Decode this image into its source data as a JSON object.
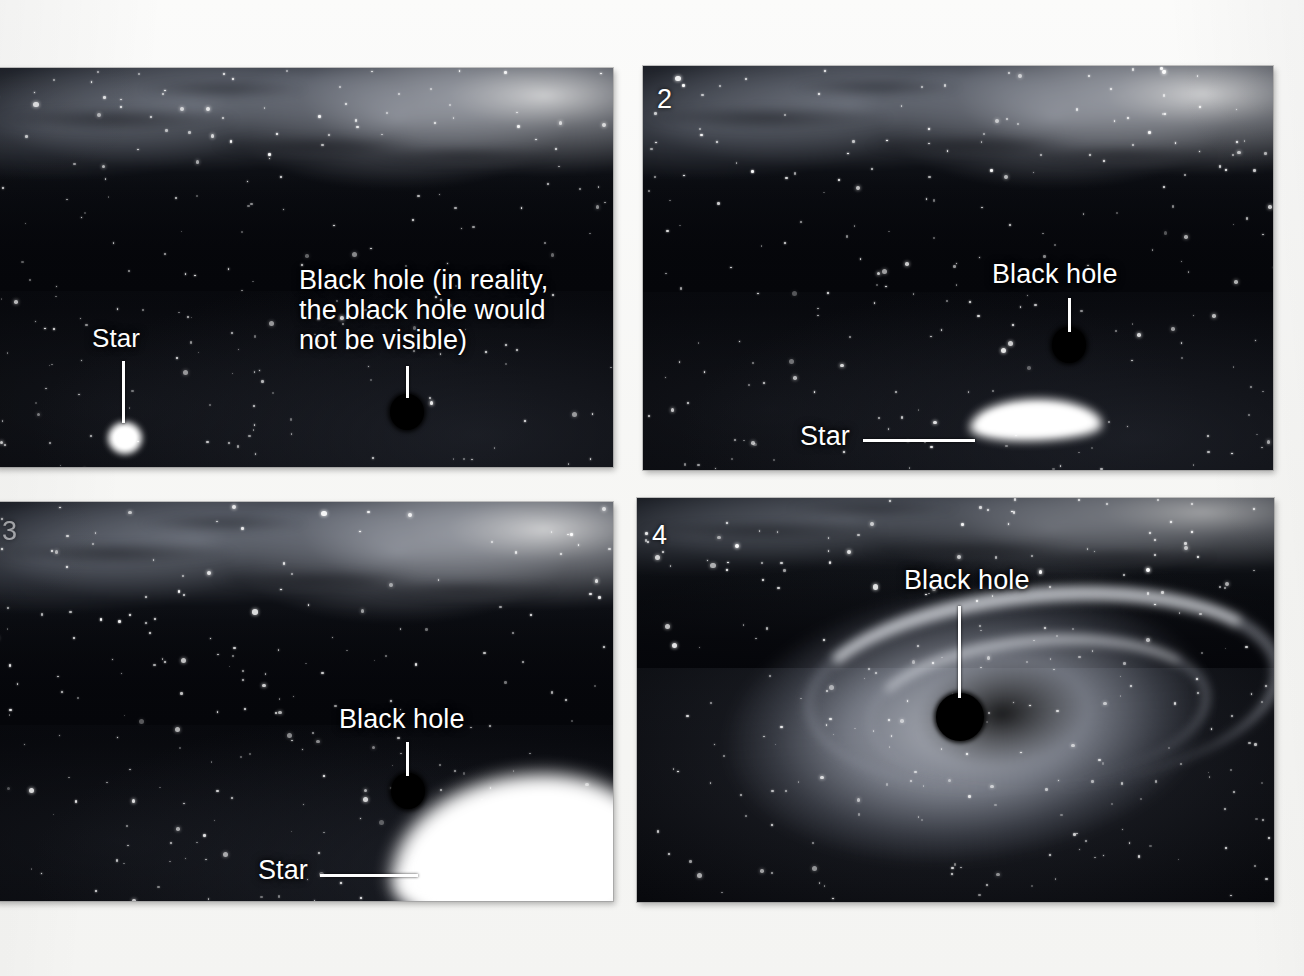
{
  "figure": {
    "background_color": "#f6f6f4",
    "panel_count": 4,
    "caption_font_color": "#ffffff"
  },
  "panels": [
    {
      "id": "panel-1",
      "number": "1",
      "number_visible": false,
      "annotations": [
        {
          "name": "star-label",
          "text": "Star",
          "font_size": 26
        },
        {
          "name": "black-hole-label",
          "text": "Black hole (in reality,\nthe black hole would\nnot be visible)",
          "font_size": 27
        }
      ],
      "objects": {
        "star": "point-star",
        "black_hole": "small-disc"
      }
    },
    {
      "id": "panel-2",
      "number": "2",
      "number_visible": true,
      "annotations": [
        {
          "name": "black-hole-label",
          "text": "Black hole",
          "font_size": 27
        },
        {
          "name": "star-label",
          "text": "Star",
          "font_size": 27
        }
      ],
      "objects": {
        "star": "stretched-crescent-star",
        "black_hole": "small-disc"
      }
    },
    {
      "id": "panel-3",
      "number": "3",
      "number_visible": false,
      "annotations": [
        {
          "name": "black-hole-label",
          "text": "Black hole",
          "font_size": 27
        },
        {
          "name": "star-label",
          "text": "Star",
          "font_size": 27
        }
      ],
      "objects": {
        "star": "heavily-stretched-star",
        "black_hole": "small-disc"
      }
    },
    {
      "id": "panel-4",
      "number": "4",
      "number_visible": true,
      "annotations": [
        {
          "name": "black-hole-label",
          "text": "Black hole",
          "font_size": 27
        }
      ],
      "objects": {
        "accretion_disk": "bright-spiral-disk",
        "black_hole": "large-disc"
      }
    }
  ]
}
